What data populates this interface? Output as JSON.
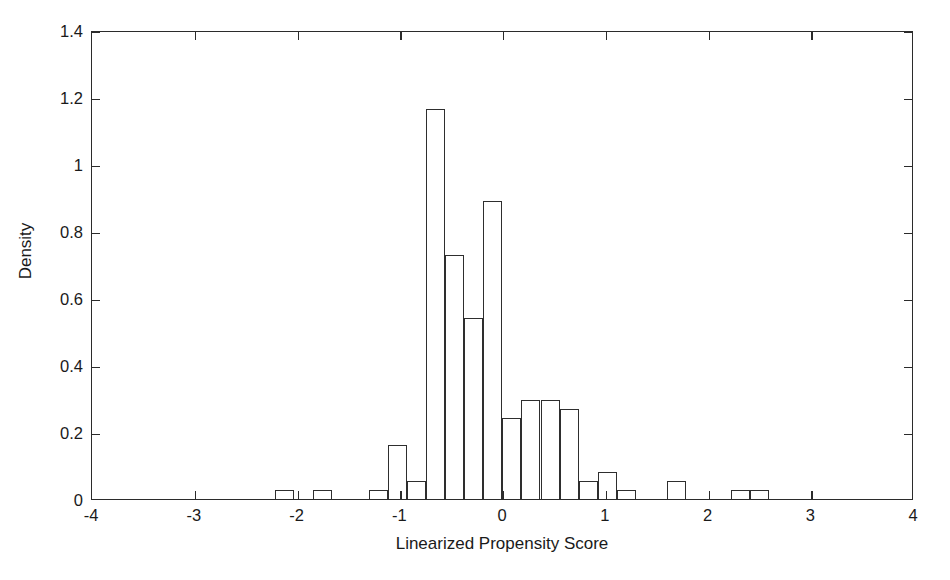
{
  "chart_data": {
    "type": "bar",
    "title": "",
    "subtitle": "",
    "xlabel": "Linearized Propensity Score",
    "ylabel": "Density",
    "xlim": [
      -4,
      4
    ],
    "ylim": [
      0,
      1.4
    ],
    "grid": false,
    "legend": null,
    "annotations": [],
    "xticks": [
      -4,
      -3,
      -2,
      -1,
      0,
      1,
      2,
      3,
      4
    ],
    "xtick_labels": [
      "-4",
      "-3",
      "-2",
      "-1",
      "0",
      "1",
      "2",
      "3",
      "4"
    ],
    "yticks": [
      0,
      0.2,
      0.4,
      0.6,
      0.8,
      1,
      1.2,
      1.4
    ],
    "ytick_labels": [
      "0",
      "0.2",
      "0.4",
      "0.6",
      "0.8",
      "1",
      "1.2",
      "1.4"
    ],
    "bin_width": 0.185,
    "bins": [
      {
        "x_left": -2.22,
        "x_right": -2.035,
        "value": 0.027
      },
      {
        "x_left": -1.85,
        "x_right": -1.665,
        "value": 0.027
      },
      {
        "x_left": -1.3,
        "x_right": -1.115,
        "value": 0.027
      },
      {
        "x_left": -1.115,
        "x_right": -0.93,
        "value": 0.162
      },
      {
        "x_left": -0.93,
        "x_right": -0.745,
        "value": 0.054
      },
      {
        "x_left": -0.745,
        "x_right": -0.56,
        "value": 1.163
      },
      {
        "x_left": -0.56,
        "x_right": -0.375,
        "value": 0.727
      },
      {
        "x_left": -0.375,
        "x_right": -0.19,
        "value": 0.539
      },
      {
        "x_left": -0.19,
        "x_right": -0.005,
        "value": 0.889
      },
      {
        "x_left": -0.005,
        "x_right": 0.18,
        "value": 0.242
      },
      {
        "x_left": 0.18,
        "x_right": 0.365,
        "value": 0.296
      },
      {
        "x_left": 0.365,
        "x_right": 0.55,
        "value": 0.296
      },
      {
        "x_left": 0.55,
        "x_right": 0.735,
        "value": 0.269
      },
      {
        "x_left": 0.735,
        "x_right": 0.92,
        "value": 0.054
      },
      {
        "x_left": 0.92,
        "x_right": 1.105,
        "value": 0.081
      },
      {
        "x_left": 1.105,
        "x_right": 1.29,
        "value": 0.027
      },
      {
        "x_left": 1.6,
        "x_right": 1.785,
        "value": 0.054
      },
      {
        "x_left": 2.22,
        "x_right": 2.405,
        "value": 0.027
      },
      {
        "x_left": 2.405,
        "x_right": 2.59,
        "value": 0.027
      }
    ]
  },
  "style": {
    "axis_color": "#2b2b2b",
    "bar_edge_color": "#2e2e2e",
    "bar_fill_color": "transparent",
    "background_color": "#ffffff",
    "text_color": "#1a1a1a"
  }
}
